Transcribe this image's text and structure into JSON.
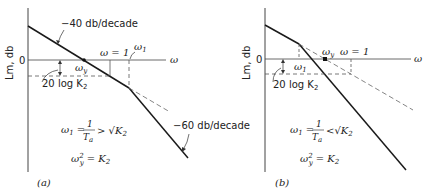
{
  "figure": {
    "panels": [
      {
        "id": "a",
        "caption": "(a)",
        "y_axis_label": "Lm, db",
        "zero_label": "0",
        "x_axis_label": "ω",
        "slope_label_top": "−40 db/decade",
        "slope_label_bottom": "−60 db/decade",
        "omega_one_label": "ω = 1",
        "omega_1_label": "ω",
        "omega_1_sub": "1",
        "omega_y_label": "ω",
        "omega_y_sub": "y",
        "gain_label": "20 log K",
        "gain_sub": "2",
        "eq1_lhs": "ω",
        "eq1_lhs_sub": "1",
        "eq1_num": "1",
        "eq1_den": "T",
        "eq1_den_sub": "a",
        "eq1_rel": ">",
        "eq1_rhs": "√K",
        "eq1_rhs_sub": "2",
        "eq2_lhs": "ω",
        "eq2_sup": "2",
        "eq2_sub": "y",
        "eq2_rhs": "= K",
        "eq2_rhs_sub": "2"
      },
      {
        "id": "b",
        "caption": "(b)",
        "y_axis_label": "Lm, db",
        "zero_label": "0",
        "x_axis_label": "ω",
        "omega_one_label": "ω = 1",
        "omega_1_label": "ω",
        "omega_1_sub": "1",
        "omega_y_label": "ω",
        "omega_y_sub": "y",
        "gain_label": "20 log K",
        "gain_sub": "2",
        "eq1_lhs": "ω",
        "eq1_lhs_sub": "1",
        "eq1_num": "1",
        "eq1_den": "T",
        "eq1_den_sub": "a",
        "eq1_rel": "<",
        "eq1_rhs": "√K",
        "eq1_rhs_sub": "2",
        "eq2_lhs": "ω",
        "eq2_sup": "2",
        "eq2_sub": "y",
        "eq2_rhs": "= K",
        "eq2_rhs_sub": "2"
      }
    ],
    "colors": {
      "line": "#1a1a1a",
      "axis": "#444444",
      "dashed": "#555555"
    }
  }
}
